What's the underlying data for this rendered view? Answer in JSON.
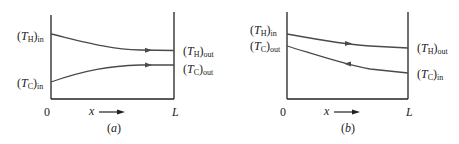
{
  "panels": [
    {
      "id": "a",
      "caption": "(a)",
      "flow": "parallel-flow",
      "labels": {
        "th_in": {
          "sym": "T",
          "sub": "H",
          "suffix": "in"
        },
        "tc_in": {
          "sym": "T",
          "sub": "C",
          "suffix": "in"
        },
        "th_out": {
          "sym": "T",
          "sub": "H",
          "suffix": "out"
        },
        "tc_out": {
          "sym": "T",
          "sub": "C",
          "suffix": "out"
        }
      },
      "axis": {
        "origin": "0",
        "end": "L",
        "var": "x"
      },
      "arrows": {
        "hot": "right",
        "cold": "right"
      }
    },
    {
      "id": "b",
      "caption": "(b)",
      "flow": "counter-flow",
      "labels": {
        "th_in": {
          "sym": "T",
          "sub": "H",
          "suffix": "in"
        },
        "tc_out": {
          "sym": "T",
          "sub": "C",
          "suffix": "out"
        },
        "th_out": {
          "sym": "T",
          "sub": "H",
          "suffix": "out"
        },
        "tc_in": {
          "sym": "T",
          "sub": "C",
          "suffix": "in"
        }
      },
      "axis": {
        "origin": "0",
        "end": "L",
        "var": "x"
      },
      "arrows": {
        "hot": "right",
        "cold": "left"
      }
    }
  ],
  "colors": {
    "line": "#4a4a4a",
    "axis": "#222222"
  }
}
